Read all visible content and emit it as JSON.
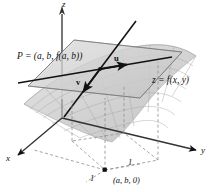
{
  "figure": {
    "kind": "3d-surface-tangent-plane-diagram",
    "background_color": "#ffffff",
    "ink_color": "#111111",
    "surface_fill": "#d9d9d9",
    "plane_fill": "#c9c9c9",
    "dashed_color": "#8a8a8a",
    "axes": {
      "z_label": "z",
      "x_label": "x",
      "y_label": "y"
    },
    "labels": {
      "point_P": "P = (a, b, f(a, b))",
      "surface": "z = f(x, y)",
      "base_point": "(a, b, 0)",
      "unit_y": "1",
      "unit_x": "1"
    },
    "vectors": {
      "u": "u",
      "v": "v"
    }
  }
}
